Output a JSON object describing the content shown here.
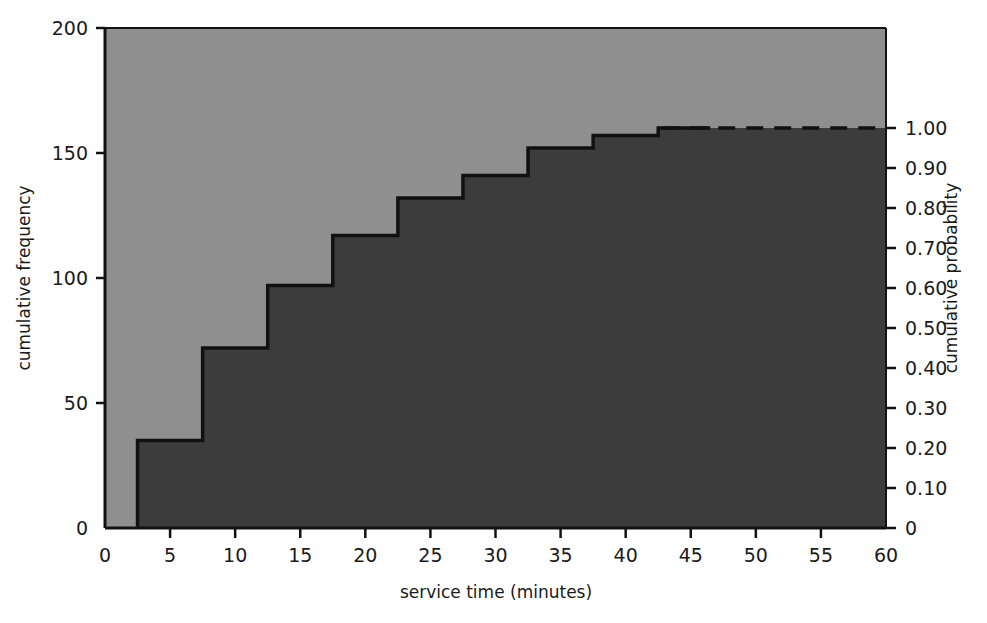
{
  "chart_data": {
    "type": "line",
    "subtype": "cumulative-frequency-ogive-step",
    "title": "",
    "xlabel": "service time (minutes)",
    "ylabel": "cumulative frequency",
    "y2label": "cumulative probability",
    "xlim": [
      0,
      60
    ],
    "ylim": [
      0,
      200
    ],
    "y2lim": [
      0,
      1.25
    ],
    "grid": false,
    "legend": null,
    "x_ticks": [
      0,
      5,
      10,
      15,
      20,
      25,
      30,
      35,
      40,
      45,
      50,
      55,
      60
    ],
    "x_tick_labels": [
      "0",
      "5",
      "10",
      "15",
      "20",
      "25",
      "30",
      "35",
      "40",
      "45",
      "50",
      "55",
      "60"
    ],
    "y_ticks": [
      0,
      50,
      100,
      150,
      200
    ],
    "y_tick_labels": [
      "0",
      "50",
      "100",
      "150",
      "200"
    ],
    "y2_ticks": [
      0,
      0.1,
      0.2,
      0.3,
      0.4,
      0.5,
      0.6,
      0.7,
      0.8,
      0.9,
      1.0
    ],
    "y2_tick_labels": [
      "0",
      "0.10",
      "0.20",
      "0.30",
      "0.40",
      "0.50",
      "0.60",
      "0.70",
      "0.80",
      "0.90",
      "1.00"
    ],
    "total_frequency": 160,
    "step_rise_x": [
      2.5,
      7.5,
      12.5,
      17.5,
      22.5,
      27.5,
      32.5,
      37.5,
      42.5
    ],
    "cumulative_frequency": [
      35,
      72,
      97,
      117,
      132,
      141,
      152,
      157,
      160
    ],
    "cumulative_probability": [
      0.22,
      0.45,
      0.61,
      0.73,
      0.83,
      0.88,
      0.95,
      0.98,
      1.0
    ],
    "plateau_start_x": 42.5,
    "plateau_end_x": 60,
    "plateau_value": 160,
    "plateau_dashed": true,
    "colors": {
      "area_below": "#3c3c3c",
      "area_above": "#8f8f8f",
      "line": "#111111",
      "text": "#1a1a1a",
      "background": "#ffffff"
    }
  },
  "axes": {
    "left_title": "cumulative frequency",
    "right_title": "cumulative probability",
    "bottom_title": "service time (minutes)"
  }
}
